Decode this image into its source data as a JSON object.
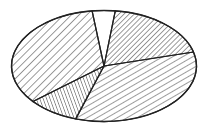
{
  "chart_data": {
    "type": "pie",
    "title": "",
    "style": "hatched 3D-flattened ellipse, no labels",
    "categories": [
      "Slice A (blank)",
      "Slice B (left, hatched)",
      "Slice C (small, dense hatch)",
      "Slice D (bottom, hatched)",
      "Slice E (upper right, dense hatch)"
    ],
    "values": [
      4,
      34,
      9,
      34,
      19
    ],
    "unit": "percent (estimated)",
    "legend": "none",
    "colors": {
      "stroke": "#222222",
      "fill": "#ffffff"
    }
  }
}
